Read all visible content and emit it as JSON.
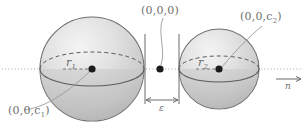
{
  "figure": {
    "name": "two-spheres-geometry-diagram",
    "background": "#ffffff",
    "stroke_color": "#6b6b6b",
    "label_color": "#6f6f6f",
    "axis_style": "dotted",
    "width": 305,
    "height": 125
  },
  "labels": {
    "origin": "(0,0,0)",
    "center_left": "(0,0,c",
    "center_left_sub": "1",
    "center_left_close": ")",
    "center_right": "(0,0,c",
    "center_right_sub": "2",
    "center_right_close": ")",
    "radius_left": "r",
    "radius_left_sub": "1",
    "radius_right": "r",
    "radius_right_sub": "2",
    "gap": "ε",
    "normal_vector": "n"
  },
  "geometry": {
    "sphere_left": {
      "cx": 92,
      "cy": 69,
      "r": 52,
      "fill_light": "#f0f0f0",
      "fill_dark": "#b9b9b9"
    },
    "sphere_right": {
      "cx": 219,
      "cy": 69,
      "r": 40,
      "fill_light": "#f0f0f0",
      "fill_dark": "#b9b9b9"
    },
    "origin_point": {
      "x": 160,
      "y": 69
    },
    "tangent_line_left_x": 145,
    "tangent_line_right_x": 179,
    "gap_dimension_y": 100,
    "axis_y": 69,
    "arrow": {
      "x1": 276,
      "x2": 301,
      "y": 79
    }
  }
}
